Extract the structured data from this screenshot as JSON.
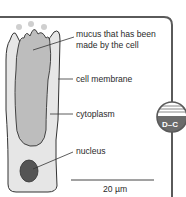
{
  "diagram": {
    "labels": {
      "mucus_line1": "mucus that has been",
      "mucus_line2": "made by the cell",
      "cell_membrane": "cell membrane",
      "cytoplasm": "cytoplasm",
      "nucleus": "nucleus"
    },
    "scale_bar": "20 µm",
    "badge": "D–C"
  },
  "colors": {
    "frame": "#5a5a5a",
    "cell_fill": "#e6e6e6",
    "mucus_fill": "#bdbdbd",
    "nucleus_fill": "#555555",
    "badge_dark": "#6b6b6b"
  }
}
